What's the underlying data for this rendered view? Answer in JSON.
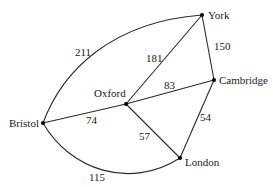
{
  "diagram": {
    "type": "weighted-graph",
    "nodes": {
      "york": {
        "label": "York"
      },
      "cambridge": {
        "label": "Cambridge"
      },
      "oxford": {
        "label": "Oxford"
      },
      "bristol": {
        "label": "Bristol"
      },
      "london": {
        "label": "London"
      }
    },
    "edges": {
      "bristol_york": {
        "from": "Bristol",
        "to": "York",
        "weight": "211"
      },
      "oxford_york": {
        "from": "Oxford",
        "to": "York",
        "weight": "181"
      },
      "york_cambridge": {
        "from": "York",
        "to": "Cambridge",
        "weight": "150"
      },
      "oxford_cambridge": {
        "from": "Oxford",
        "to": "Cambridge",
        "weight": "83"
      },
      "bristol_oxford": {
        "from": "Bristol",
        "to": "Oxford",
        "weight": "74"
      },
      "oxford_london": {
        "from": "Oxford",
        "to": "London",
        "weight": "57"
      },
      "cambridge_london": {
        "from": "Cambridge",
        "to": "London",
        "weight": "54"
      },
      "bristol_london": {
        "from": "Bristol",
        "to": "London",
        "weight": "115"
      }
    }
  }
}
